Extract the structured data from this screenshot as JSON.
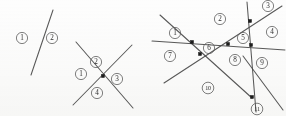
{
  "figure": {
    "canvas": {
      "width": 286,
      "height": 116,
      "background": "#fdfdfd"
    },
    "style": {
      "line_color": "#4a4a4a",
      "vertex_color": "#1c1c1c",
      "label_color": "#2e2e2e",
      "label_circle_color": "#5a5a5a"
    },
    "panels": [
      {
        "id": "panel-1",
        "name": "single-line-arrangement",
        "line_count": 1,
        "vertex_count": 0,
        "region_count": 2,
        "lines": [
          {
            "id": "p1-l1",
            "x1": 31,
            "y1": 75,
            "x2": 53,
            "y2": 10
          }
        ],
        "vertices": [],
        "labels": [
          {
            "text": "1",
            "cx": 22,
            "cy": 38,
            "r": 5.6
          },
          {
            "text": "2",
            "cx": 52,
            "cy": 38,
            "r": 5.6
          }
        ]
      },
      {
        "id": "panel-2",
        "name": "two-crossing-lines-arrangement",
        "line_count": 2,
        "vertex_count": 1,
        "region_count": 4,
        "lines": [
          {
            "id": "p2-l1",
            "x1": 76,
            "y1": 42,
            "x2": 133,
            "y2": 108
          },
          {
            "id": "p2-l2",
            "x1": 73,
            "y1": 105,
            "x2": 132,
            "y2": 45
          }
        ],
        "vertices": [
          {
            "id": "p2-v1",
            "cx": 103,
            "cy": 76
          }
        ],
        "labels": [
          {
            "text": "2",
            "cx": 96,
            "cy": 62,
            "r": 5.6
          },
          {
            "text": "1",
            "cx": 81,
            "cy": 74,
            "r": 5.6
          },
          {
            "text": "3",
            "cx": 117,
            "cy": 79,
            "r": 5.6
          },
          {
            "text": "4",
            "cx": 97,
            "cy": 93,
            "r": 5.6
          }
        ]
      },
      {
        "id": "panel-3",
        "name": "five-line-arrangement",
        "line_count": 5,
        "vertex_count": 5,
        "region_count": 11,
        "lines": [
          {
            "id": "p3-l1",
            "x1": 160,
            "y1": 15,
            "x2": 252,
            "y2": 98
          },
          {
            "id": "p3-l2",
            "x1": 152,
            "y1": 41,
            "x2": 285,
            "y2": 50
          },
          {
            "id": "p3-l3",
            "x1": 164,
            "y1": 83,
            "x2": 282,
            "y2": 6
          },
          {
            "id": "p3-l4",
            "x1": 247,
            "y1": 2,
            "x2": 256,
            "y2": 112
          },
          {
            "id": "p3-l5",
            "x1": 283,
            "y1": 110,
            "x2": 243,
            "y2": 56
          }
        ],
        "vertices": [
          {
            "id": "p3-v1",
            "cx": 192,
            "cy": 42
          },
          {
            "id": "p3-v2",
            "cx": 200,
            "cy": 54
          },
          {
            "id": "p3-v3",
            "cx": 228,
            "cy": 44
          },
          {
            "id": "p3-v4",
            "cx": 251,
            "cy": 45
          },
          {
            "id": "p3-v5",
            "cx": 250,
            "cy": 21
          },
          {
            "id": "p3-v6",
            "cx": 252,
            "cy": 97
          }
        ],
        "labels": [
          {
            "text": "1",
            "cx": 175,
            "cy": 33,
            "r": 5.6
          },
          {
            "text": "2",
            "cx": 220,
            "cy": 19,
            "r": 5.6
          },
          {
            "text": "3",
            "cx": 268,
            "cy": 6,
            "r": 5.6
          },
          {
            "text": "4",
            "cx": 272,
            "cy": 32,
            "r": 5.6
          },
          {
            "text": "5",
            "cx": 243,
            "cy": 38,
            "r": 5.6
          },
          {
            "text": "6",
            "cx": 209,
            "cy": 48,
            "r": 5.6
          },
          {
            "text": "7",
            "cx": 170,
            "cy": 56,
            "r": 5.6
          },
          {
            "text": "8",
            "cx": 235,
            "cy": 60,
            "r": 5.6
          },
          {
            "text": "9",
            "cx": 262,
            "cy": 63,
            "r": 5.6
          },
          {
            "text": "10",
            "cx": 208,
            "cy": 88,
            "r": 5.8
          },
          {
            "text": "11",
            "cx": 257,
            "cy": 109,
            "r": 5.8
          }
        ]
      }
    ]
  }
}
